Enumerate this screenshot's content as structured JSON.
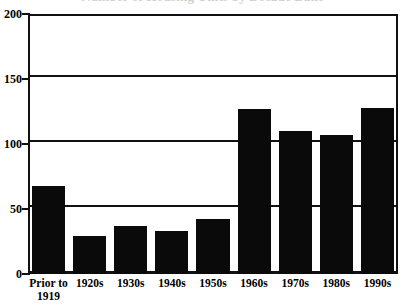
{
  "chart_data": {
    "type": "bar",
    "title": "",
    "xlabel": "",
    "ylabel": "",
    "categories": [
      "Prior to 1919",
      "1920s",
      "1930s",
      "1940s",
      "1950s",
      "1960s",
      "1970s",
      "1980s",
      "1990s"
    ],
    "values": [
      68,
      29,
      37,
      33,
      42,
      127,
      110,
      107,
      128
    ],
    "ylim": [
      0,
      200
    ],
    "yticks": [
      0,
      50,
      100,
      150,
      200
    ],
    "ytick_labels": [
      "0",
      "50",
      "100",
      "150",
      "200"
    ],
    "grid": true,
    "gridlines_horizontal_only": true,
    "legend": null,
    "bar_color": "#0a0a0a",
    "axis_color": "#111111",
    "background_color": "#ffffff"
  },
  "axes": {
    "y": {
      "ticks": [
        {
          "label": "200",
          "value": 200
        },
        {
          "label": "150",
          "value": 150
        },
        {
          "label": "100",
          "value": 100
        },
        {
          "label": "50",
          "value": 50
        },
        {
          "label": "0",
          "value": 0
        }
      ]
    },
    "x": {
      "ticks": [
        {
          "line1": "Prior to",
          "line2": "1919"
        },
        {
          "line1": "1920s",
          "line2": ""
        },
        {
          "line1": "1930s",
          "line2": ""
        },
        {
          "line1": "1940s",
          "line2": ""
        },
        {
          "line1": "1950s",
          "line2": ""
        },
        {
          "line1": "1960s",
          "line2": ""
        },
        {
          "line1": "1970s",
          "line2": ""
        },
        {
          "line1": "1980s",
          "line2": ""
        },
        {
          "line1": "1990s",
          "line2": ""
        }
      ]
    }
  },
  "title_sliver": {
    "text": "Number of Housing Units by Decade Built"
  }
}
